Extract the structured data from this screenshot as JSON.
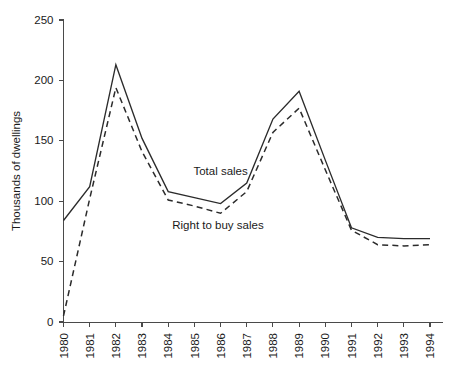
{
  "chart_data": {
    "type": "line",
    "title": "",
    "xlabel": "",
    "ylabel": "Thousands of dwellings",
    "x": [
      1980,
      1981,
      1982,
      1983,
      1984,
      1985,
      1986,
      1987,
      1988,
      1989,
      1990,
      1991,
      1992,
      1993,
      1994
    ],
    "categories": [
      "1980",
      "1981",
      "1982",
      "1983",
      "1984",
      "1985",
      "1986",
      "1987",
      "1988",
      "1989",
      "1990",
      "1991",
      "1992",
      "1993",
      "1994"
    ],
    "series": [
      {
        "name": "Total sales",
        "style": "solid",
        "values": [
          84,
          112,
          213,
          152,
          108,
          103,
          98,
          115,
          168,
          191,
          134,
          78,
          70,
          69,
          69
        ]
      },
      {
        "name": "Right to buy sales",
        "style": "dashed",
        "values": [
          5,
          102,
          194,
          141,
          101,
          96,
          90,
          108,
          157,
          177,
          126,
          76,
          64,
          63,
          64
        ]
      }
    ],
    "ylim": [
      0,
      250
    ],
    "yticks": [
      0,
      50,
      100,
      150,
      200,
      250
    ],
    "ytick_labels": [
      "0",
      "50",
      "100",
      "150",
      "200",
      "250"
    ],
    "xlim": [
      1980,
      1994
    ],
    "grid": false,
    "legend_position": "inline-annotations",
    "annotations": [
      {
        "text": "Total sales",
        "x": 1986,
        "y": 122
      },
      {
        "text": "Right to buy sales",
        "x": 1985.9,
        "y": 77
      }
    ]
  },
  "axes": {
    "y_axis_title": "Thousands of dwellings"
  }
}
